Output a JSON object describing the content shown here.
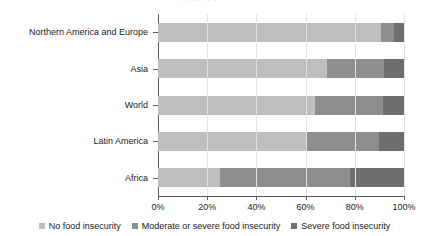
{
  "chart_data": {
    "type": "bar",
    "orientation": "horizontal",
    "stacked": true,
    "title": "",
    "xlabel": "",
    "ylabel": "",
    "categories": [
      "Northern America and Europe",
      "Asia",
      "World",
      "Latin America",
      "Africa"
    ],
    "series": [
      {
        "name": "No food insecurity",
        "color": "#bfbfbf",
        "values": [
          90.5,
          68.5,
          64.0,
          60.5,
          25.0
        ]
      },
      {
        "name": "Moderate or severe food insecurity",
        "color": "#8e8e8e",
        "values": [
          5.5,
          23.5,
          27.5,
          29.5,
          53.0
        ]
      },
      {
        "name": "Severe food insecurity",
        "color": "#6e6e6e",
        "values": [
          4.0,
          8.0,
          8.5,
          10.0,
          22.0
        ]
      }
    ],
    "xlim": [
      0,
      100
    ],
    "xticks": [
      0,
      20,
      40,
      60,
      80,
      100
    ],
    "xticklabels": [
      "0%",
      "20%",
      "40%",
      "60%",
      "80%",
      "100%"
    ],
    "grid": "vertical",
    "legend_position": "bottom"
  },
  "axis": {
    "x_tick_labels": [
      "0%",
      "20%",
      "40%",
      "60%",
      "80%",
      "100%"
    ],
    "y_tick_labels": [
      "Northern America and Europe",
      "Asia",
      "World",
      "Latin America",
      "Africa"
    ]
  },
  "legend": {
    "items": [
      {
        "label": "No food insecurity",
        "color": "#bfbfbf"
      },
      {
        "label": "Moderate or severe food insecurity",
        "color": "#8e8e8e"
      },
      {
        "label": "Severe food insecurity",
        "color": "#6e6e6e"
      }
    ]
  },
  "artifact": {
    "top_clipped_text": "·  ·   · ·   ·      ·  ·"
  }
}
